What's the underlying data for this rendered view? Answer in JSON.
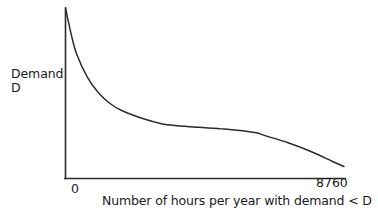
{
  "figure": {
    "background_color": "#ffffff",
    "line_color": "#2b2b2b",
    "text_color": "#1a1a1a"
  },
  "axes": {
    "y_label_line1": "Demand",
    "y_label_line2": "D",
    "x_label": "Number of hours per year with demand < D",
    "x_tick_min": "0",
    "x_tick_max": "8760"
  },
  "chart_data": {
    "type": "line",
    "title": "",
    "xlabel": "Number of hours per year with demand < D",
    "ylabel": "Demand D",
    "grid": false,
    "legend": null,
    "xlim": [
      0,
      8760
    ],
    "ylim": [
      0,
      100
    ],
    "xticks": [
      0,
      8760
    ],
    "xticklabels": [
      "0",
      "8760"
    ],
    "yticks": [],
    "yticklabels": [],
    "series": [
      {
        "name": "Load duration curve",
        "x": [
          0,
          175,
          350,
          700,
          1050,
          1400,
          1750,
          2450,
          3050,
          3500,
          4200,
          5000,
          5950,
          6300,
          7000,
          7700,
          8400,
          8760
        ],
        "y": [
          100,
          85,
          73,
          59,
          50,
          44,
          40,
          35,
          32,
          31,
          30,
          29,
          27,
          25,
          21,
          16,
          10,
          7
        ]
      }
    ],
    "annotations": []
  }
}
